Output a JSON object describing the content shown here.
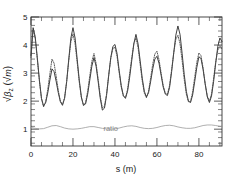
{
  "chart_data": {
    "type": "line",
    "title": "",
    "xlabel": "s (m)",
    "ylabel": "√β_z (√m)",
    "ylabel_parts": {
      "radical": "√",
      "beta": "β",
      "sub": "z",
      "unit_open": "(",
      "unit_radical": "√",
      "unit": "m",
      "unit_close": ")"
    },
    "xlim": [
      0,
      91
    ],
    "ylim": [
      0.4,
      5.0
    ],
    "xticks": [
      0,
      20,
      40,
      60,
      80
    ],
    "xticklabels": [
      "0",
      "20",
      "40",
      "60",
      "80"
    ],
    "yticks": [
      1,
      2,
      3,
      4,
      5
    ],
    "yticklabels": [
      "1",
      "2",
      "3",
      "4",
      "5"
    ],
    "minor_ticks": true,
    "grid": false,
    "legend": null,
    "annotations": [
      {
        "text": "ratio",
        "x": 38,
        "y": 0.92,
        "name": "ratio-annotation"
      }
    ],
    "series": [
      {
        "name": "sqrt-beta-z-solid",
        "style": "solid",
        "color": "#2a2a2a",
        "linewidth": 0.9,
        "x": [
          0,
          1,
          2,
          3,
          4,
          5,
          6,
          7,
          8,
          9,
          10,
          11,
          12,
          13,
          14,
          15,
          16,
          17,
          18,
          19,
          20,
          21,
          22,
          23,
          24,
          25,
          26,
          27,
          28,
          29,
          30,
          31,
          32,
          33,
          34,
          35,
          36,
          37,
          38,
          39,
          40,
          41,
          42,
          43,
          44,
          45,
          46,
          47,
          48,
          49,
          50,
          51,
          52,
          53,
          54,
          55,
          56,
          57,
          58,
          59,
          60,
          61,
          62,
          63,
          64,
          65,
          66,
          67,
          68,
          69,
          70,
          71,
          72,
          73,
          74,
          75,
          76,
          77,
          78,
          79,
          80,
          81,
          82,
          83,
          84,
          85,
          86,
          87,
          88,
          89,
          90,
          91
        ],
        "y": [
          3.62,
          4.62,
          4.3,
          3.55,
          2.75,
          2.1,
          1.82,
          1.95,
          2.3,
          2.75,
          3.15,
          3.05,
          2.7,
          2.3,
          1.98,
          1.85,
          2.1,
          2.7,
          3.5,
          4.25,
          4.62,
          4.25,
          3.5,
          2.75,
          2.15,
          1.85,
          1.9,
          2.25,
          2.75,
          3.25,
          3.55,
          3.25,
          2.7,
          2.1,
          1.68,
          1.75,
          2.2,
          2.9,
          3.55,
          3.95,
          4.02,
          3.7,
          3.1,
          2.55,
          2.2,
          2.1,
          2.35,
          2.85,
          3.45,
          4.05,
          4.38,
          4.05,
          3.45,
          2.82,
          2.35,
          2.15,
          2.3,
          2.7,
          3.15,
          3.5,
          3.6,
          3.35,
          2.92,
          2.5,
          2.25,
          2.2,
          2.48,
          3.05,
          3.72,
          4.35,
          4.68,
          4.38,
          3.7,
          2.95,
          2.35,
          2.0,
          1.95,
          2.22,
          2.7,
          3.2,
          3.58,
          3.52,
          3.12,
          2.6,
          2.15,
          1.95,
          2.18,
          2.7,
          3.35,
          3.95,
          4.25,
          4.12
        ]
      },
      {
        "name": "sqrt-beta-z-dotted",
        "style": "dotted",
        "color": "#4a4a4a",
        "linewidth": 0.9,
        "x": [
          0,
          1,
          2,
          3,
          4,
          5,
          6,
          7,
          8,
          9,
          10,
          11,
          12,
          13,
          14,
          15,
          16,
          17,
          18,
          19,
          20,
          21,
          22,
          23,
          24,
          25,
          26,
          27,
          28,
          29,
          30,
          31,
          32,
          33,
          34,
          35,
          36,
          37,
          38,
          39,
          40,
          41,
          42,
          43,
          44,
          45,
          46,
          47,
          48,
          49,
          50,
          51,
          52,
          53,
          54,
          55,
          56,
          57,
          58,
          59,
          60,
          61,
          62,
          63,
          64,
          65,
          66,
          67,
          68,
          69,
          70,
          71,
          72,
          73,
          74,
          75,
          76,
          77,
          78,
          79,
          80,
          81,
          82,
          83,
          84,
          85,
          86,
          87,
          88,
          89,
          90,
          91
        ],
        "y": [
          3.55,
          4.55,
          4.25,
          3.5,
          2.72,
          2.08,
          1.8,
          1.98,
          2.42,
          2.98,
          3.5,
          3.35,
          2.88,
          2.38,
          2.0,
          1.88,
          2.12,
          2.7,
          3.45,
          4.12,
          4.4,
          4.05,
          3.38,
          2.68,
          2.12,
          1.85,
          1.95,
          2.35,
          2.9,
          3.42,
          3.7,
          3.35,
          2.78,
          2.18,
          1.76,
          1.82,
          2.25,
          2.92,
          3.52,
          3.88,
          3.92,
          3.6,
          3.02,
          2.5,
          2.18,
          2.12,
          2.42,
          2.98,
          3.55,
          4.05,
          4.25,
          3.92,
          3.32,
          2.72,
          2.28,
          2.12,
          2.35,
          2.82,
          3.32,
          3.68,
          3.78,
          3.48,
          3.0,
          2.55,
          2.28,
          2.25,
          2.55,
          3.12,
          3.72,
          4.2,
          4.35,
          4.05,
          3.45,
          2.78,
          2.25,
          1.98,
          1.98,
          2.32,
          2.85,
          3.38,
          3.72,
          3.62,
          3.18,
          2.62,
          2.18,
          2.0,
          2.25,
          2.8,
          3.4,
          3.82,
          3.98,
          3.85
        ]
      },
      {
        "name": "ratio-curve",
        "style": "solid",
        "color": "#9a9a9a",
        "linewidth": 0.8,
        "x": [
          0,
          2,
          4,
          6,
          8,
          10,
          12,
          14,
          16,
          18,
          20,
          22,
          24,
          26,
          28,
          30,
          32,
          34,
          36,
          38,
          40,
          42,
          44,
          46,
          48,
          50,
          52,
          54,
          56,
          58,
          60,
          62,
          64,
          66,
          68,
          70,
          72,
          74,
          76,
          78,
          80,
          82,
          84,
          86,
          88,
          90,
          91
        ],
        "y": [
          1.06,
          1.03,
          1.01,
          1.02,
          1.07,
          1.12,
          1.13,
          1.09,
          1.04,
          1.01,
          1.0,
          1.01,
          1.03,
          1.06,
          1.09,
          1.09,
          1.06,
          1.03,
          1.01,
          1.0,
          1.01,
          1.04,
          1.08,
          1.11,
          1.12,
          1.1,
          1.06,
          1.03,
          1.02,
          1.03,
          1.06,
          1.1,
          1.13,
          1.14,
          1.12,
          1.08,
          1.05,
          1.03,
          1.03,
          1.05,
          1.09,
          1.13,
          1.15,
          1.15,
          1.13,
          1.1,
          1.09
        ]
      }
    ]
  },
  "axes": {
    "frame_color": "#333333",
    "background": "#ffffff"
  }
}
